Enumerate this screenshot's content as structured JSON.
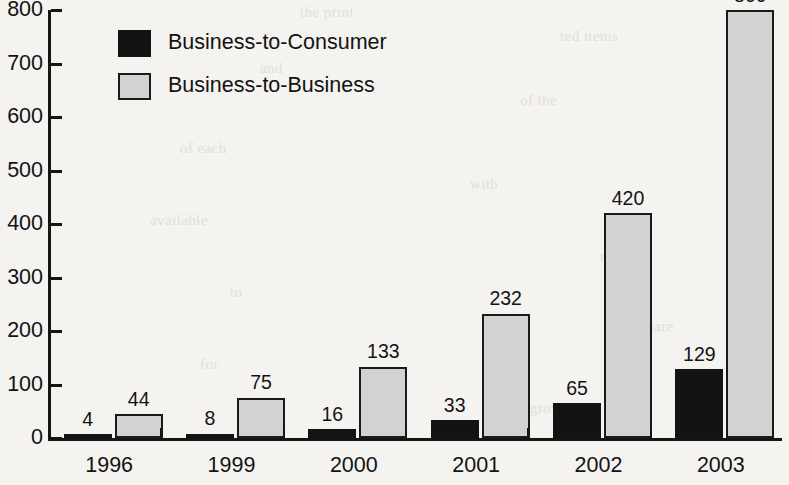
{
  "chart_data": {
    "type": "bar",
    "title": "",
    "subtitle": "",
    "xlabel": "",
    "ylabel": "",
    "categories": [
      "1996",
      "1999",
      "2000",
      "2001",
      "2002",
      "2003"
    ],
    "series": [
      {
        "name": "Business-to-Consumer",
        "color": "#131313",
        "values": [
          4,
          8,
          16,
          33,
          65,
          129
        ]
      },
      {
        "name": "Business-to-Business",
        "color": "#d2d2d2",
        "values": [
          44,
          75,
          133,
          232,
          420,
          800
        ]
      }
    ],
    "value_labels": {
      "Business-to-Consumer": [
        "4",
        "8",
        "16",
        "33",
        "65",
        "129"
      ],
      "Business-to-Business": [
        "44",
        "75",
        "133",
        "232",
        "420",
        "800"
      ]
    },
    "ylim": [
      0,
      800
    ],
    "ytick_step": 100,
    "ytick_labels": [
      "800",
      "700",
      "600",
      "500",
      "400",
      "300",
      "200",
      "100",
      "0"
    ],
    "ytick_values": [
      800,
      700,
      600,
      500,
      400,
      300,
      200,
      100,
      0
    ],
    "grid": false,
    "legend_position": "upper-left-inside"
  },
  "legend": {
    "entries": [
      {
        "label": "Business-to-Consumer",
        "swatch": "black-filled-square"
      },
      {
        "label": "Business-to-Business",
        "swatch": "gray-filled-square"
      }
    ]
  },
  "background_text": {
    "lines": [
      "the print",
      "ted items",
      "and",
      "of the",
      "of each",
      "with",
      "available",
      "market",
      "to",
      "share",
      "for",
      "growth"
    ]
  },
  "colors": {
    "b2c": "#131313",
    "b2b": "#d2d2d2",
    "axis": "#151515",
    "page": "#f4f3f0"
  }
}
